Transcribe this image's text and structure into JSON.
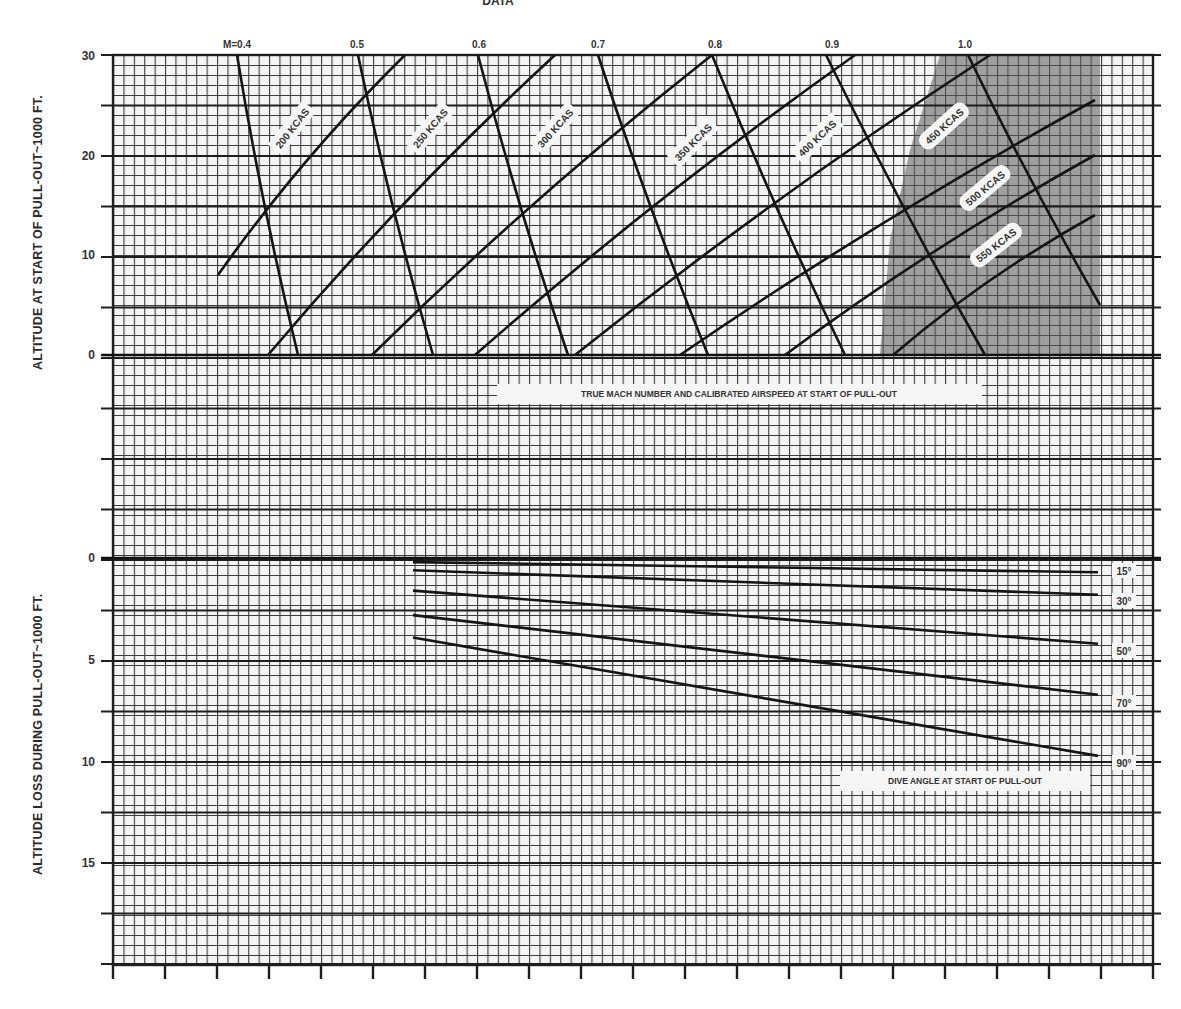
{
  "header_fragment": "DATA",
  "chart_data": [
    {
      "type": "line",
      "name": "upper-chart",
      "title": "",
      "ylabel": "ALTITUDE AT START OF PULL-OUT~1000 FT.",
      "xlabel": "TRUE MACH NUMBER AND CALIBRATED AIRSPEED AT START OF PULL-OUT",
      "yticks": [
        "30",
        "20",
        "10",
        "0"
      ],
      "ylim": [
        0,
        30
      ],
      "grid": true,
      "mach_lines": [
        {
          "label": "M=0.4",
          "points": [
            [
              237,
              55
            ],
            [
              298,
              355
            ]
          ]
        },
        {
          "label": "0.5",
          "points": [
            [
              358,
              55
            ],
            [
              433,
              355
            ]
          ]
        },
        {
          "label": "0.6",
          "points": [
            [
              478,
              55
            ],
            [
              568,
              355
            ]
          ]
        },
        {
          "label": "0.7",
          "points": [
            [
              598,
              55
            ],
            [
              708,
              355
            ]
          ]
        },
        {
          "label": "0.8",
          "points": [
            [
              712,
              55
            ],
            [
              845,
              355
            ]
          ]
        },
        {
          "label": "0.9",
          "points": [
            [
              826,
              55
            ],
            [
              985,
              355
            ]
          ]
        },
        {
          "label": "1.0",
          "points": [
            [
              968,
              55
            ],
            [
              1100,
              305
            ]
          ]
        }
      ],
      "kcas_lines": [
        {
          "label": "200 KCAS",
          "points": [
            [
              218,
              275
            ],
            [
              405,
              55
            ]
          ]
        },
        {
          "label": "250 KCAS",
          "points": [
            [
              268,
              355
            ],
            [
              555,
              55
            ]
          ]
        },
        {
          "label": "300 KCAS",
          "points": [
            [
              372,
              355
            ],
            [
              712,
              55
            ]
          ]
        },
        {
          "label": "350 KCAS",
          "points": [
            [
              475,
              355
            ],
            [
              855,
              55
            ]
          ]
        },
        {
          "label": "400 KCAS",
          "points": [
            [
              575,
              355
            ],
            [
              990,
              55
            ]
          ]
        },
        {
          "label": "450 KCAS",
          "points": [
            [
              680,
              355
            ],
            [
              1095,
              100
            ]
          ]
        },
        {
          "label": "500 KCAS",
          "points": [
            [
              785,
              355
            ],
            [
              1095,
              155
            ]
          ]
        },
        {
          "label": "550 KCAS",
          "points": [
            [
              893,
              355
            ],
            [
              1095,
              215
            ]
          ]
        }
      ],
      "shaded_region": "transonic (approx. M 0.95-1.0+, right side)"
    },
    {
      "type": "line",
      "name": "lower-chart",
      "title": "",
      "ylabel": "ALTITUDE LOSS DURING PULL-OUT~1000 FT.",
      "xlabel": "DIVE ANGLE AT START OF PULL-OUT",
      "yticks": [
        "0",
        "5",
        "10",
        "15"
      ],
      "ylim": [
        0,
        20
      ],
      "y_inverted": true,
      "grid": true,
      "series": [
        {
          "name": "15°",
          "start": 0.2,
          "end": 0.7
        },
        {
          "name": "30°",
          "start": 0.6,
          "end": 1.8
        },
        {
          "name": "50°",
          "start": 1.6,
          "end": 4.2
        },
        {
          "name": "70°",
          "start": 2.8,
          "end": 6.7
        },
        {
          "name": "90°",
          "start": 3.9,
          "end": 9.7
        }
      ]
    }
  ],
  "labels": {
    "upper_ylabel": "ALTITUDE AT START OF PULL-OUT~1000 FT.",
    "lower_ylabel": "ALTITUDE LOSS DURING PULL-OUT~1000 FT.",
    "upper_banner": "TRUE MACH NUMBER AND CALIBRATED AIRSPEED AT START OF PULL-OUT",
    "lower_banner": "DIVE ANGLE AT START OF PULL-OUT",
    "upper_ticks": [
      "30",
      "20",
      "10",
      "0"
    ],
    "lower_ticks": [
      "0",
      "5",
      "10",
      "15"
    ],
    "mach": [
      "M=0.4",
      "0.5",
      "0.6",
      "0.7",
      "0.8",
      "0.9",
      "1.0"
    ],
    "kcas": [
      "200 KCAS",
      "250 KCAS",
      "300 KCAS",
      "350 KCAS",
      "400 KCAS",
      "450 KCAS",
      "500 KCAS",
      "550 KCAS"
    ],
    "angles": [
      "15°",
      "30°",
      "50°",
      "70°",
      "90°"
    ]
  },
  "colors": {
    "ink": "#1a1a1a",
    "grid": "#3a3a3a",
    "paper": "#ffffff",
    "shade": "#6e6e6e"
  }
}
